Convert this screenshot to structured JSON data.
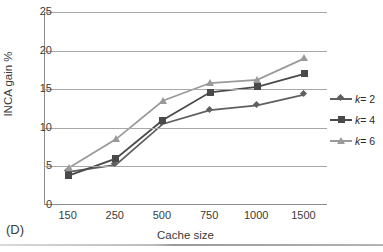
{
  "panel": {
    "label": "(D)"
  },
  "chart_data": {
    "type": "line",
    "title": "",
    "xlabel": "Cache size",
    "ylabel": "INCA gain %",
    "categories": [
      "150",
      "250",
      "500",
      "750",
      "1000",
      "1500"
    ],
    "ylim": [
      0,
      25
    ],
    "yticks": [
      "0",
      "5",
      "10",
      "15",
      "20",
      "25"
    ],
    "grid": true,
    "legend_position": "right",
    "series": [
      {
        "name": "k = 2",
        "marker": "diamond",
        "color": "#5f5f5f",
        "values": [
          4.3,
          5.2,
          10.5,
          12.3,
          12.9,
          14.3
        ]
      },
      {
        "name": "k = 4",
        "marker": "square",
        "color": "#4a4a4a",
        "values": [
          3.8,
          6.0,
          11.0,
          14.6,
          15.3,
          17.0
        ]
      },
      {
        "name": "k = 6",
        "marker": "triangle",
        "color": "#9a9a9a",
        "values": [
          4.8,
          8.5,
          13.5,
          15.8,
          16.2,
          19.0
        ]
      }
    ]
  },
  "legend": {
    "items": [
      {
        "symbol": "k",
        "equals": "=",
        "value": "2"
      },
      {
        "symbol": "k",
        "equals": "=",
        "value": "4"
      },
      {
        "symbol": "k",
        "equals": "=",
        "value": "6"
      }
    ]
  },
  "colors": {
    "series_k2": "#5f5f5f",
    "series_k4": "#4a4a4a",
    "series_k6": "#9a9a9a",
    "gridline": "#a8a8a8",
    "axis": "#8c8c8c",
    "text": "#3a3a3a",
    "background": "#ffffff"
  }
}
